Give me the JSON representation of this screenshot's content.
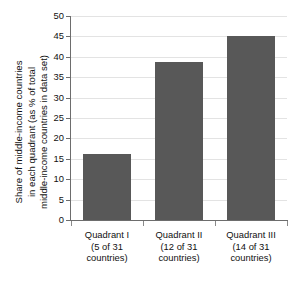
{
  "chart_data": {
    "type": "bar",
    "title": "",
    "subtitle": "",
    "xlabel": "",
    "ylabel": "Share of middle-income countries in each quadrant (as % of total middle-income countries in data set)",
    "ylabel_lines": [
      "Share of middle-income countries",
      "in each quadrant (as % of total",
      "middle-income countries in data set)"
    ],
    "categories": [
      "Quadrant I",
      "Quadrant II",
      "Quadrant III"
    ],
    "category_lines": [
      [
        "Quadrant I",
        "(5 of 31",
        "countries)"
      ],
      [
        "Quadrant II",
        "(12 of 31",
        "countries)"
      ],
      [
        "Quadrant III",
        "(14 of 31",
        "countries)"
      ]
    ],
    "values": [
      16.1,
      38.7,
      45.2
    ],
    "ylim": [
      0,
      50
    ],
    "ytick_step": 5,
    "ytick_labels": [
      "50",
      "45",
      "40",
      "35",
      "30",
      "25",
      "20",
      "15",
      "10",
      "5",
      "0"
    ],
    "ytick_values": [
      50,
      45,
      40,
      35,
      30,
      25,
      20,
      15,
      10,
      5,
      0
    ],
    "grid": true,
    "grid_axis": "y",
    "legend": false,
    "legend_position": "none",
    "colors": {
      "bar": "#585858",
      "gridline": "#e3e3e3",
      "axis": "#6d6d6d",
      "text": "#111111",
      "background": "#ffffff"
    }
  }
}
